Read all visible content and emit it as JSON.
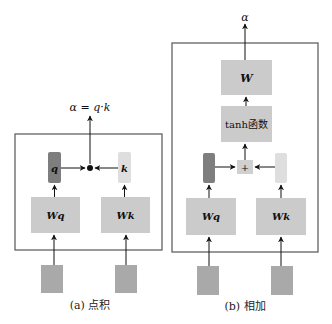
{
  "diagram": {
    "colors": {
      "box_fill": "#cbcbcb",
      "input_fill": "#a9a9a9",
      "frame": "#555555",
      "q_fill": "#7e7e7e",
      "k_fill": "#dedede",
      "plus_fill": "#d0d0d0"
    },
    "panel_a": {
      "caption": "(a) 点积",
      "output_label": "α = q·k",
      "query_label": "q",
      "key_label": "k",
      "wq_label": "Wq",
      "wk_label": "Wk",
      "combine_symbol": "●"
    },
    "panel_b": {
      "caption": "(b) 相加",
      "output_label": "α",
      "w_label": "W",
      "tanh_label": "tanh函数",
      "combine_symbol": "+",
      "wq_label": "Wq",
      "wk_label": "Wk"
    }
  }
}
